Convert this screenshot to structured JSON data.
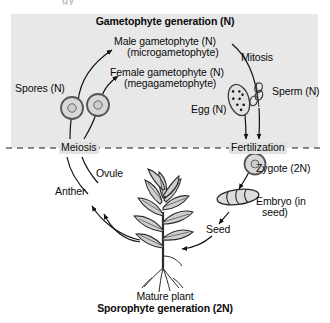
{
  "figure": {
    "title_top": "Gametophyte generation (N)",
    "title_bottom_plain": "Mature plant",
    "title_bottom_bold": "Sporophyte generation (2N)",
    "top_cropped_fragment": "gy"
  },
  "panel": {
    "background_color": "#e8e8e8",
    "label_background_color": "#e3e3e3",
    "divider_style": "dashed"
  },
  "stages": [
    {
      "name": "meiosis",
      "label": "Meiosis"
    },
    {
      "name": "fertilization",
      "label": "Fertilization"
    }
  ],
  "labels": {
    "spores": "Spores (N)",
    "male_gametophyte_line1": "Male gametophyte (N)",
    "male_gametophyte_line2": "(microgametophyte)",
    "female_gametophyte_line1": "Female gametophyte (N)",
    "female_gametophyte_line2": "(megagametophyte)",
    "mitosis": "Mitosis",
    "sperm": "Sperm (N)",
    "egg": "Egg (N)",
    "zygote": "Zygote (2N)",
    "embryo_line1": "Embryo (in",
    "embryo_line2": "seed)",
    "seed": "Seed",
    "anther": "Anther",
    "ovule": "Ovule"
  },
  "structures": [
    {
      "name": "spore-cell-left",
      "type": "circle-with-nucleus"
    },
    {
      "name": "spore-cell-right",
      "type": "circle-with-nucleus"
    },
    {
      "name": "egg-sac",
      "type": "oval-with-dots",
      "dot_count": 8
    },
    {
      "name": "sperm-cells",
      "type": "twisted-elongated"
    },
    {
      "name": "zygote-cell",
      "type": "circle-with-nucleus"
    },
    {
      "name": "seed-embryo",
      "type": "segmented-oval",
      "segment_count": 4
    },
    {
      "name": "mature-plant",
      "type": "plant-illustration"
    }
  ],
  "colors": {
    "text": "#0a0a0a",
    "panel": "#e8e8e8",
    "stroke": "#1a1a1a",
    "cell_fill": "#d8d8d8",
    "cell_stroke": "#555555"
  }
}
